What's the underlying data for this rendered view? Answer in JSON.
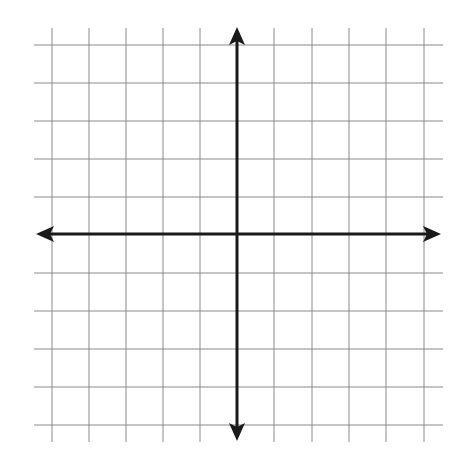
{
  "diagram": {
    "type": "coordinate-plane",
    "grid": {
      "columns": 10,
      "rows": 10,
      "labels": "none",
      "line_color": "#8a8a8a",
      "vertical_lines_x": [
        52,
        89,
        126,
        163,
        200,
        274,
        312,
        349,
        386,
        424
      ],
      "horizontal_lines_y": [
        45,
        83,
        121,
        159,
        197,
        273,
        311,
        349,
        387,
        425
      ],
      "vertical_extent": [
        28,
        442
      ],
      "horizontal_extent": [
        34,
        443
      ]
    },
    "axes": {
      "color": "#1a1a1a",
      "origin": [
        237,
        234
      ],
      "x_axis": {
        "from": 36,
        "to": 441,
        "arrows": "both"
      },
      "y_axis": {
        "from": 27,
        "to": 441,
        "arrows": "both"
      }
    }
  }
}
